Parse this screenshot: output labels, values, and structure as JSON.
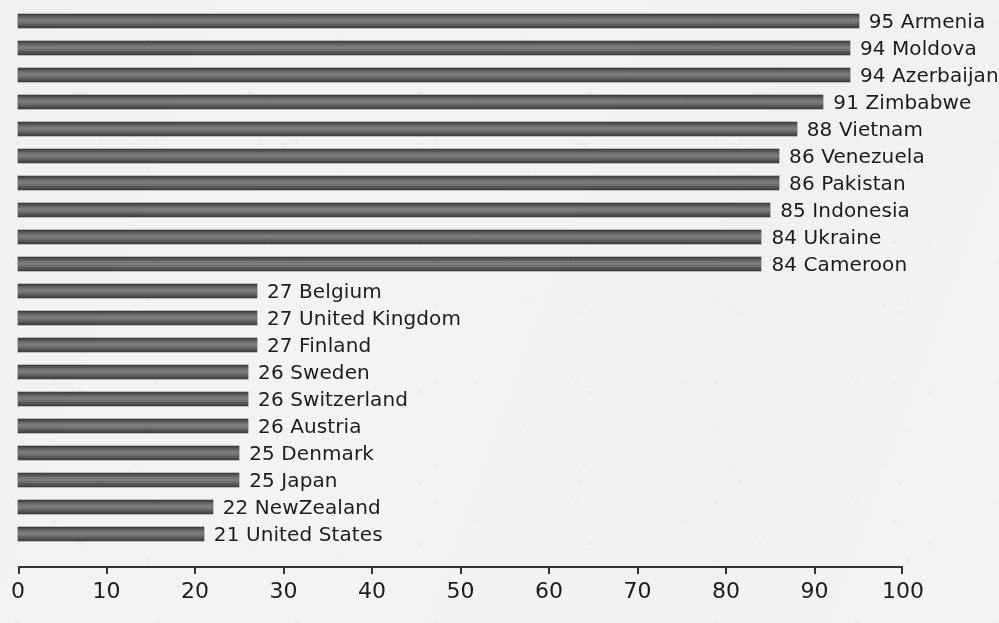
{
  "chart_data": {
    "type": "bar",
    "orientation": "horizontal",
    "title": "",
    "subtitle": "",
    "xlabel": "",
    "ylabel": "",
    "xlim": [
      0,
      100
    ],
    "grid": false,
    "legend": null,
    "data_labels": "value and category shown at end of each bar",
    "categories": [
      "Armenia",
      "Moldova",
      "Azerbaijan",
      "Zimbabwe",
      "Vietnam",
      "Venezuela",
      "Pakistan",
      "Indonesia",
      "Ukraine",
      "Cameroon",
      "Belgium",
      "United Kingdom",
      "Finland",
      "Sweden",
      "Switzerland",
      "Austria",
      "Denmark",
      "Japan",
      "NewZealand",
      "United States"
    ],
    "values": [
      95,
      94,
      94,
      91,
      88,
      86,
      86,
      85,
      84,
      84,
      27,
      27,
      27,
      26,
      26,
      26,
      25,
      25,
      22,
      21
    ],
    "xticks": [
      0,
      10,
      20,
      30,
      40,
      50,
      60,
      70,
      80,
      90,
      100
    ],
    "xticklabels": [
      "0",
      "10",
      "20",
      "30",
      "40",
      "50",
      "60",
      "70",
      "80",
      "90",
      "100"
    ],
    "bar_color": "#6d6d6d",
    "background_color": "#f4f3f1",
    "text_color": "#1d1d1d"
  },
  "bars": [
    {
      "value": 95,
      "label": "95 Armenia"
    },
    {
      "value": 94,
      "label": "94 Moldova"
    },
    {
      "value": 94,
      "label": "94 Azerbaijan"
    },
    {
      "value": 91,
      "label": "91 Zimbabwe"
    },
    {
      "value": 88,
      "label": "88 Vietnam"
    },
    {
      "value": 86,
      "label": "86 Venezuela"
    },
    {
      "value": 86,
      "label": "86 Pakistan"
    },
    {
      "value": 85,
      "label": "85 Indonesia"
    },
    {
      "value": 84,
      "label": "84 Ukraine"
    },
    {
      "value": 84,
      "label": "84 Cameroon"
    },
    {
      "value": 27,
      "label": "27 Belgium"
    },
    {
      "value": 27,
      "label": "27 United Kingdom"
    },
    {
      "value": 27,
      "label": "27 Finland"
    },
    {
      "value": 26,
      "label": "26 Sweden"
    },
    {
      "value": 26,
      "label": "26 Switzerland"
    },
    {
      "value": 26,
      "label": "26 Austria"
    },
    {
      "value": 25,
      "label": "25 Denmark"
    },
    {
      "value": 25,
      "label": "25 Japan"
    },
    {
      "value": 22,
      "label": "22 NewZealand"
    },
    {
      "value": 21,
      "label": "21 United States"
    }
  ],
  "axis": {
    "ticks": [
      {
        "value": 0,
        "label": "0"
      },
      {
        "value": 10,
        "label": "10"
      },
      {
        "value": 20,
        "label": "20"
      },
      {
        "value": 30,
        "label": "30"
      },
      {
        "value": 40,
        "label": "40"
      },
      {
        "value": 50,
        "label": "50"
      },
      {
        "value": 60,
        "label": "60"
      },
      {
        "value": 70,
        "label": "70"
      },
      {
        "value": 80,
        "label": "80"
      },
      {
        "value": 90,
        "label": "90"
      },
      {
        "value": 100,
        "label": "100"
      }
    ]
  },
  "geometry": {
    "origin_x": 18,
    "px_per_unit": 8.85,
    "row_pitch": 27,
    "first_row_top": 6,
    "label_gap": 10
  }
}
